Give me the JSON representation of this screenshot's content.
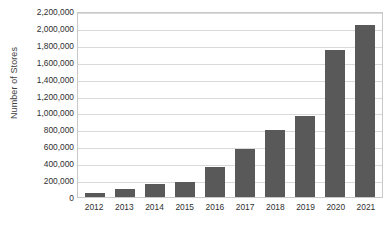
{
  "chart_data": {
    "type": "bar",
    "title": "",
    "subtitle": "",
    "xlabel": "",
    "ylabel": "Number of Stores",
    "categories": [
      "2012",
      "2013",
      "2014",
      "2015",
      "2016",
      "2017",
      "2018",
      "2019",
      "2020",
      "2021"
    ],
    "values": [
      50000,
      90000,
      150000,
      180000,
      350000,
      570000,
      790000,
      960000,
      1740000,
      2040000
    ],
    "series": [
      {
        "name": "Number of Stores",
        "values": [
          50000,
          90000,
          150000,
          180000,
          350000,
          570000,
          790000,
          960000,
          1740000,
          2040000
        ]
      }
    ],
    "ylim": [
      0,
      2200000
    ],
    "ytick_values": [
      0,
      200000,
      400000,
      600000,
      800000,
      1000000,
      1200000,
      1400000,
      1600000,
      1800000,
      2000000,
      2200000
    ],
    "ytick_labels": [
      "2,200,000",
      "2,000,000",
      "1,800,000",
      "1,600,000",
      "1,400,000",
      "1,200,000",
      "1,000,000",
      "800,000",
      "600,000",
      "400,000",
      "200,000",
      "0"
    ],
    "grid": true,
    "grid_axis": "y",
    "legend": false,
    "legend_position": "none",
    "bar_color": "#595959",
    "gridline_color": "#d9d9d9",
    "plot_border_color": "#c8c8c8",
    "background_color": "#ffffff",
    "text_color": "#2f2f2f",
    "annotations": []
  }
}
